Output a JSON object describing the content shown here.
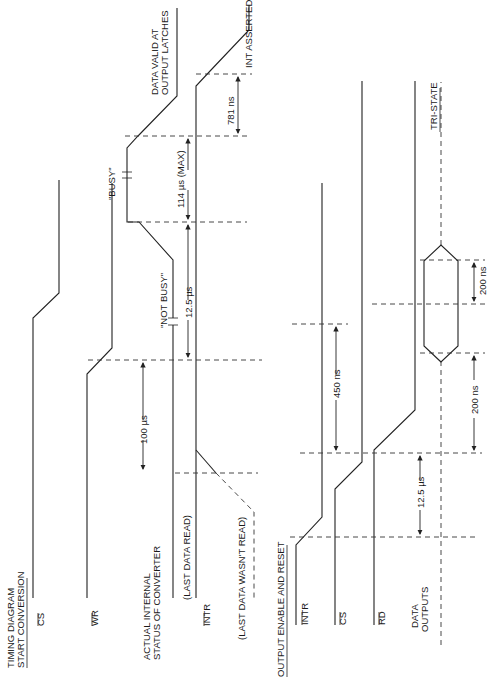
{
  "figure": {
    "orientation": "rotated 90° counter-clockwise",
    "title_start": "TIMING DIAGRAM",
    "title_start_2": "START CONVERSION",
    "title_output": "OUTPUT ENABLE AND RESET"
  },
  "signals_start": {
    "cs": "CS",
    "wr": "WR",
    "status_1": "ACTUAL INTERNAL",
    "status_2": "STATUS OF CONVERTER",
    "last_read": "(LAST DATA READ)",
    "intr": "INTR",
    "last_not_read": "(LAST DATA WASN'T READ)"
  },
  "signals_output": {
    "intr": "INTR",
    "cs": "CS",
    "rd": "RD",
    "data_1": "DATA",
    "data_2": "OUTPUTS"
  },
  "annotations": {
    "not_busy": "\"NOT BUSY\"",
    "busy": "\"BUSY\"",
    "data_valid_1": "DATA VALID AT",
    "data_valid_2": "OUTPUT LATCHES",
    "int_asserted": "INT ASSERTED",
    "tri_state": "TRI-STATE"
  },
  "timings": {
    "t_100us": "100 µs",
    "t_12_5us_a": "12.5 µs",
    "t_114us": "114 µs (MAX)",
    "t_781ns": "781 ns",
    "t_450ns": "450 ns",
    "t_12_5us_b": "12.5 µs",
    "t_200ns_a": "200 ns",
    "t_200ns_b": "200 ns"
  }
}
